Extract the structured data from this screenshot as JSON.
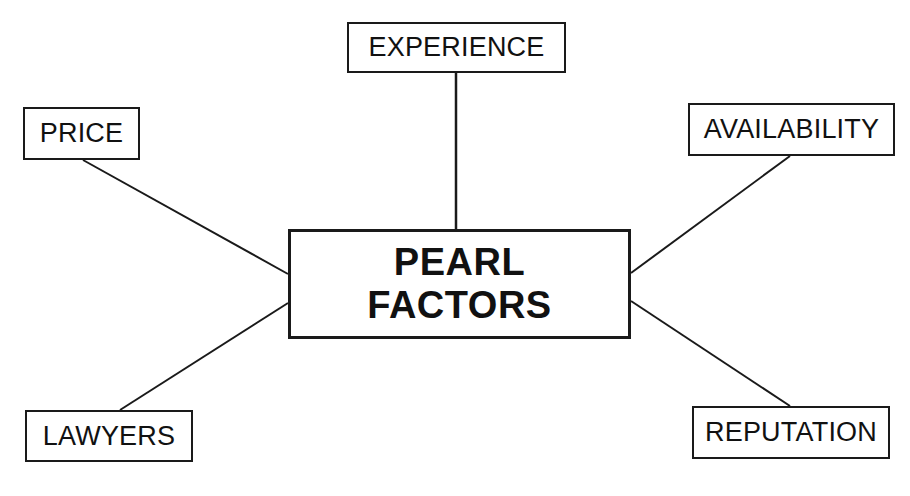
{
  "diagram": {
    "type": "hub-and-spoke concept map",
    "background_color": "#ffffff",
    "line_color": "#1a1a1a",
    "text_color": "#111111",
    "hub": {
      "label": "PEARL\nFACTORS",
      "line1": "PEARL",
      "line2": "FACTORS",
      "bold": true,
      "x": 288,
      "y": 229,
      "width": 343,
      "height": 110
    },
    "nodes": [
      {
        "id": "experience",
        "label": "EXPERIENCE",
        "x": 347,
        "y": 22,
        "width": 219,
        "height": 51
      },
      {
        "id": "price",
        "label": "PRICE",
        "x": 23,
        "y": 107,
        "width": 117,
        "height": 53
      },
      {
        "id": "availability",
        "label": "AVAILABILITY",
        "x": 688,
        "y": 103,
        "width": 207,
        "height": 53
      },
      {
        "id": "lawyers",
        "label": "LAWYERS",
        "x": 25,
        "y": 410,
        "width": 168,
        "height": 52
      },
      {
        "id": "reputation",
        "label": "REPUTATION",
        "x": 692,
        "y": 406,
        "width": 198,
        "height": 53
      }
    ],
    "edges": [
      {
        "from": "experience",
        "to": "hub",
        "x1": 456,
        "y1": 73,
        "x2": 456,
        "y2": 229
      },
      {
        "from": "price",
        "to": "hub",
        "x1": 83,
        "y1": 160,
        "x2": 288,
        "y2": 274
      },
      {
        "from": "availability",
        "to": "hub",
        "x1": 790,
        "y1": 156,
        "x2": 631,
        "y2": 273
      },
      {
        "from": "lawyers",
        "to": "hub",
        "x1": 120,
        "y1": 410,
        "x2": 288,
        "y2": 303
      },
      {
        "from": "reputation",
        "to": "hub",
        "x1": 790,
        "y1": 406,
        "x2": 631,
        "y2": 301
      }
    ]
  }
}
